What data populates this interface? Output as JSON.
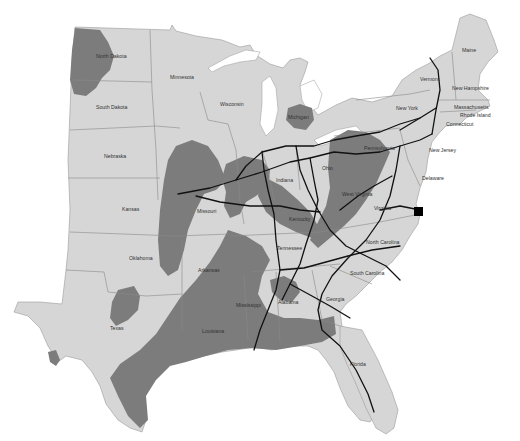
{
  "map": {
    "title": "",
    "colors": {
      "land": "#d6d6d6",
      "shaded_region": "#7c7c7c",
      "routes": "#111111",
      "marker": "#000000",
      "water": "#ffffff"
    },
    "state_labels": [
      {
        "id": "north-dakota",
        "text": "North Dakota"
      },
      {
        "id": "minnesota",
        "text": "Minnesota"
      },
      {
        "id": "wisconsin",
        "text": "Wisconsin"
      },
      {
        "id": "michigan",
        "text": "Michigan"
      },
      {
        "id": "south-dakota",
        "text": "South Dakota"
      },
      {
        "id": "nebraska",
        "text": "Nebraska"
      },
      {
        "id": "kansas",
        "text": "Kansas"
      },
      {
        "id": "missouri",
        "text": "Missouri"
      },
      {
        "id": "oklahoma",
        "text": "Oklahoma"
      },
      {
        "id": "arkansas",
        "text": "Arkansas"
      },
      {
        "id": "texas",
        "text": "Texas"
      },
      {
        "id": "louisiana",
        "text": "Louisiana"
      },
      {
        "id": "mississippi",
        "text": "Mississippi"
      },
      {
        "id": "alabama",
        "text": "Alabama"
      },
      {
        "id": "georgia",
        "text": "Georgia"
      },
      {
        "id": "florida",
        "text": "Florida"
      },
      {
        "id": "tennessee",
        "text": "Tennessee"
      },
      {
        "id": "kentucky",
        "text": "Kentucky"
      },
      {
        "id": "indiana",
        "text": "Indiana"
      },
      {
        "id": "ohio",
        "text": "Ohio"
      },
      {
        "id": "west-virginia",
        "text": "West Virginia"
      },
      {
        "id": "virginia",
        "text": "Virginia"
      },
      {
        "id": "north-carolina",
        "text": "North Carolina"
      },
      {
        "id": "south-carolina",
        "text": "South Carolina"
      },
      {
        "id": "pennsylvania",
        "text": "Pennsylvania"
      },
      {
        "id": "new-york",
        "text": "New York"
      },
      {
        "id": "new-jersey",
        "text": "New Jersey"
      },
      {
        "id": "delaware",
        "text": "Delaware"
      },
      {
        "id": "vermont",
        "text": "Vermont"
      },
      {
        "id": "new-hampshire",
        "text": "New Hampshire"
      },
      {
        "id": "maine",
        "text": "Maine"
      },
      {
        "id": "massachusetts",
        "text": "Massachusetts"
      },
      {
        "id": "rhode-island",
        "text": "Rhode Island"
      },
      {
        "id": "connecticut",
        "text": "Connecticut"
      }
    ],
    "marker": {
      "type": "square",
      "location": "Virginia coast"
    }
  }
}
